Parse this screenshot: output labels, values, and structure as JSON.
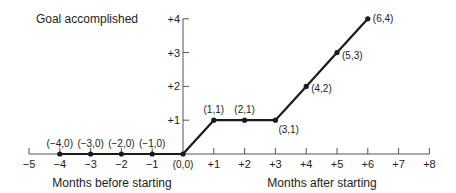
{
  "chart_data": {
    "type": "line",
    "title": "",
    "xlabel_left": "Months before starting",
    "xlabel_right": "Months after starting",
    "ylabel": "Goal accomplished",
    "xlim": [
      -5,
      8
    ],
    "ylim": [
      0,
      4
    ],
    "x_ticks": [
      "−5",
      "−4",
      "−3",
      "−2",
      "−1",
      "+1",
      "+2",
      "+3",
      "+4",
      "+5",
      "+6",
      "+7",
      "+8"
    ],
    "x_tick_values": [
      -5,
      -4,
      -3,
      -2,
      -1,
      1,
      2,
      3,
      4,
      5,
      6,
      7,
      8
    ],
    "y_ticks": [
      "+1",
      "+2",
      "+3",
      "+4"
    ],
    "y_tick_values": [
      1,
      2,
      3,
      4
    ],
    "grid": false,
    "series": [
      {
        "name": "Progress",
        "color": "#1a1a1a",
        "points": [
          {
            "x": -4,
            "y": 0,
            "label": "(−4,0)"
          },
          {
            "x": -3,
            "y": 0,
            "label": "(−3,0)"
          },
          {
            "x": -2,
            "y": 0,
            "label": "(−2,0)"
          },
          {
            "x": -1,
            "y": 0,
            "label": "(−1,0)"
          },
          {
            "x": 0,
            "y": 0,
            "label": "(0,0)"
          },
          {
            "x": 1,
            "y": 1,
            "label": "(1,1)"
          },
          {
            "x": 2,
            "y": 1,
            "label": "(2,1)"
          },
          {
            "x": 3,
            "y": 1,
            "label": "(3,1)"
          },
          {
            "x": 4,
            "y": 2,
            "label": "(4,2)"
          },
          {
            "x": 5,
            "y": 3,
            "label": "(5,3)"
          },
          {
            "x": 6,
            "y": 4,
            "label": "(6,4)"
          }
        ]
      }
    ]
  },
  "colors": {
    "axis": "#555555",
    "line": "#1a1a1a",
    "text": "#222222"
  }
}
